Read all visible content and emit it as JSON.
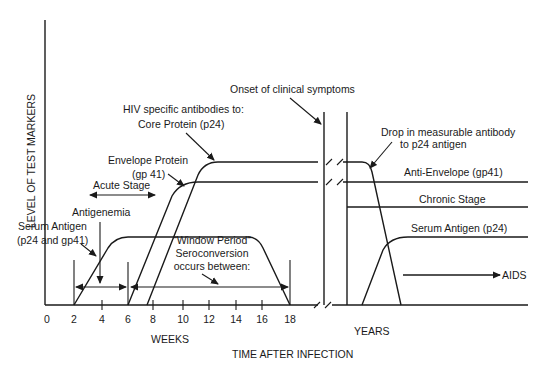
{
  "diagram": {
    "y_axis_label": "LEVEL OF TEST MARKERS",
    "x_axis_title": "TIME AFTER INFECTION",
    "weeks_label": "WEEKS",
    "years_label": "YEARS",
    "week_ticks": [
      "0",
      "2",
      "4",
      "6",
      "8",
      "10",
      "12",
      "14",
      "16",
      "18"
    ],
    "annotations": {
      "onset": "Onset of clinical symptoms",
      "hiv_antibodies_line1": "HIV specific antibodies to:",
      "core_protein": "Core Protein (p24)",
      "envelope_line1": "Envelope Protein",
      "envelope_line2": "(gp 41)",
      "acute_stage": "Acute Stage",
      "antigenemia": "Antigenemia",
      "serum_antigen_line1": "Serum Antigen",
      "serum_antigen_line2": "(p24 and gp41)",
      "window_line1": "“Window Period”",
      "window_line2": "Seroconversion",
      "window_line3": "occurs between:",
      "drop_line1": "Drop in measurable antibody",
      "drop_line2": "to p24 antigen",
      "anti_envelope": "Anti-Envelope (gp41)",
      "chronic_stage": "Chronic Stage",
      "serum_antigen_p24": "Serum Antigen (p24)",
      "aids": "AIDS"
    },
    "colors": {
      "ink": "#1a1a1a",
      "background": "#ffffff"
    }
  }
}
